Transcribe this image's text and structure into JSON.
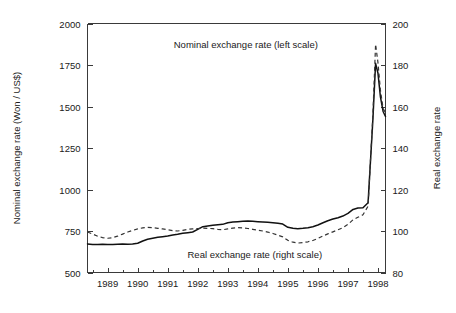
{
  "chart_data": {
    "type": "line",
    "title": "",
    "xlabel": "",
    "ylabel": "Nominal exchange rate (Won / US$)",
    "y2label": "Real exchange rate",
    "xlim": [
      1988.33,
      1998.25
    ],
    "ylim": [
      500,
      2000
    ],
    "y2lim": [
      80,
      200
    ],
    "grid": false,
    "legend_position": "inline-annotations",
    "xticks": [
      1989,
      1990,
      1991,
      1992,
      1993,
      1994,
      1995,
      1996,
      1997,
      1998
    ],
    "xtick_labels": [
      "1989",
      "1990",
      "1991",
      "1992",
      "1993",
      "1994",
      "1995",
      "1996",
      "1997",
      "1998"
    ],
    "x_minor_interval": 0.5,
    "yticks": [
      500,
      750,
      1000,
      1250,
      1500,
      1750,
      2000
    ],
    "ytick_labels": [
      "500",
      "750",
      "1000",
      "1250",
      "1500",
      "1750",
      "2000"
    ],
    "y2ticks": [
      80,
      100,
      120,
      140,
      160,
      180,
      200
    ],
    "y2tick_labels": [
      "80",
      "100",
      "120",
      "140",
      "160",
      "180",
      "200"
    ],
    "annotations": [
      {
        "name": "nominal-annotation",
        "text": "Nominal exchange rate (left scale)",
        "x": 1993.6,
        "y_px": 48
      },
      {
        "name": "real-annotation",
        "text": "Real exchange rate (right scale)",
        "x": 1993.9,
        "y_px": 258
      }
    ],
    "series": [
      {
        "name": "Nominal exchange rate (left scale)",
        "axis": "left",
        "style": "solid",
        "x": [
          1988.33,
          1988.5,
          1988.67,
          1988.83,
          1989.0,
          1989.17,
          1989.33,
          1989.5,
          1989.67,
          1989.83,
          1990.0,
          1990.17,
          1990.33,
          1990.5,
          1990.67,
          1990.83,
          1991.0,
          1991.17,
          1991.33,
          1991.5,
          1991.67,
          1991.83,
          1992.0,
          1992.17,
          1992.33,
          1992.5,
          1992.67,
          1992.83,
          1993.0,
          1993.17,
          1993.33,
          1993.5,
          1993.67,
          1993.83,
          1994.0,
          1994.17,
          1994.33,
          1994.5,
          1994.67,
          1994.83,
          1995.0,
          1995.17,
          1995.33,
          1995.5,
          1995.67,
          1995.83,
          1996.0,
          1996.17,
          1996.33,
          1996.5,
          1996.67,
          1996.83,
          1997.0,
          1997.17,
          1997.33,
          1997.5,
          1997.67,
          1997.83,
          1997.92,
          1998.0,
          1998.08,
          1998.17,
          1998.25
        ],
        "y": [
          672,
          668,
          668,
          670,
          668,
          668,
          670,
          672,
          670,
          672,
          676,
          690,
          700,
          706,
          712,
          716,
          720,
          726,
          730,
          736,
          740,
          744,
          760,
          776,
          780,
          784,
          788,
          790,
          800,
          804,
          806,
          808,
          810,
          808,
          806,
          804,
          802,
          800,
          796,
          792,
          772,
          766,
          764,
          766,
          770,
          776,
          786,
          800,
          812,
          822,
          830,
          840,
          856,
          880,
          888,
          890,
          920,
          1420,
          1760,
          1700,
          1560,
          1470,
          1440
        ]
      },
      {
        "name": "Real exchange rate (right scale)",
        "axis": "right",
        "style": "dashed",
        "x": [
          1988.33,
          1988.5,
          1988.67,
          1988.83,
          1989.0,
          1989.17,
          1989.33,
          1989.5,
          1989.67,
          1989.83,
          1990.0,
          1990.17,
          1990.33,
          1990.5,
          1990.67,
          1990.83,
          1991.0,
          1991.17,
          1991.33,
          1991.5,
          1991.67,
          1991.83,
          1992.0,
          1992.17,
          1992.33,
          1992.5,
          1992.67,
          1992.83,
          1993.0,
          1993.17,
          1993.33,
          1993.5,
          1993.67,
          1993.83,
          1994.0,
          1994.17,
          1994.33,
          1994.5,
          1994.67,
          1994.83,
          1995.0,
          1995.17,
          1995.33,
          1995.5,
          1995.67,
          1995.83,
          1996.0,
          1996.17,
          1996.33,
          1996.5,
          1996.67,
          1996.83,
          1997.0,
          1997.17,
          1997.33,
          1997.5,
          1997.67,
          1997.83,
          1997.92,
          1998.0,
          1998.08,
          1998.17,
          1998.25
        ],
        "y": [
          99.5,
          98.5,
          97.5,
          96.8,
          96.5,
          96.8,
          97.5,
          98.5,
          99.5,
          100.3,
          101.0,
          101.5,
          101.8,
          101.6,
          101.3,
          101.0,
          100.6,
          100.2,
          100.0,
          100.3,
          100.8,
          101.0,
          101.2,
          101.4,
          101.3,
          101.1,
          100.8,
          100.6,
          101.0,
          101.4,
          101.6,
          101.5,
          101.2,
          100.8,
          100.4,
          100.0,
          99.5,
          98.8,
          98.0,
          97.2,
          95.5,
          94.6,
          94.2,
          94.4,
          94.8,
          95.4,
          96.4,
          97.6,
          98.6,
          99.6,
          100.6,
          101.6,
          103.2,
          105.4,
          106.6,
          107.8,
          112.0,
          156.0,
          190.0,
          181.0,
          168.0,
          159.0,
          157.0
        ]
      }
    ]
  }
}
